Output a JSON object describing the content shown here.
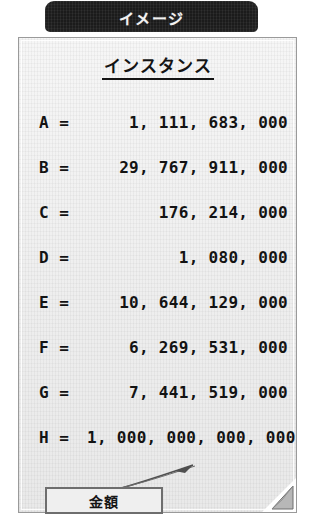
{
  "tab": {
    "label": "イメージ",
    "background_color": "#1b1b1b",
    "text_color": "#f2f2f2"
  },
  "panel": {
    "heading": "インスタンス",
    "background_color": "#f0f0f0",
    "border_color": "#9a9a9a",
    "text_color": "#131313"
  },
  "rows": [
    {
      "label": "A =",
      "value": "1, 111, 683, 000"
    },
    {
      "label": "B =",
      "value": "29, 767, 911, 000"
    },
    {
      "label": "C =",
      "value": "176, 214, 000"
    },
    {
      "label": "D =",
      "value": "1, 080, 000"
    },
    {
      "label": "E =",
      "value": "10, 644, 129, 000"
    },
    {
      "label": "F =",
      "value": "6, 269, 531, 000"
    },
    {
      "label": "G =",
      "value": "7, 441, 519, 000"
    },
    {
      "label": "H =",
      "value": "1, 000, 000, 000, 000"
    }
  ],
  "button": {
    "label": "金額"
  },
  "annotations": {
    "leader_line": "leader-line",
    "page_curl": "page-curl"
  }
}
